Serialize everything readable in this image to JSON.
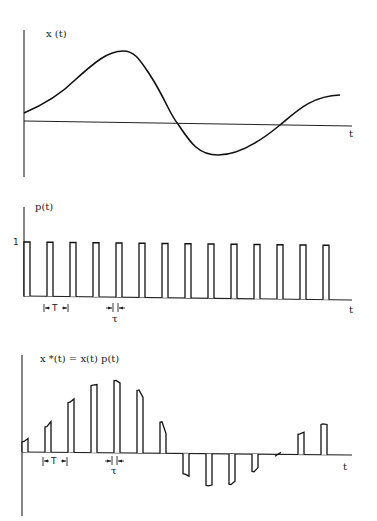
{
  "figure": {
    "panels": [
      {
        "id": "continuous-signal",
        "ylabel": "x (t)",
        "xlabel": "t"
      },
      {
        "id": "pulse-train",
        "ylabel": "p(t)",
        "xlabel": "t",
        "amplitude_label": "1",
        "period_label": "T",
        "width_label": "τ"
      },
      {
        "id": "sampled-signal",
        "ylabel": "x *(t) = x(t) p(t)",
        "xlabel": "t",
        "period_label": "T",
        "width_label": "τ"
      }
    ],
    "signal": {
      "description": "smooth continuous signal x(t)",
      "sample_values": [
        0.14,
        0.35,
        0.69,
        0.93,
        1.0,
        0.87,
        0.43,
        -0.28,
        -0.44,
        -0.42,
        -0.24,
        0.0,
        0.28,
        0.42
      ]
    },
    "pulse_train": {
      "count": 14,
      "amplitude": 1
    }
  }
}
